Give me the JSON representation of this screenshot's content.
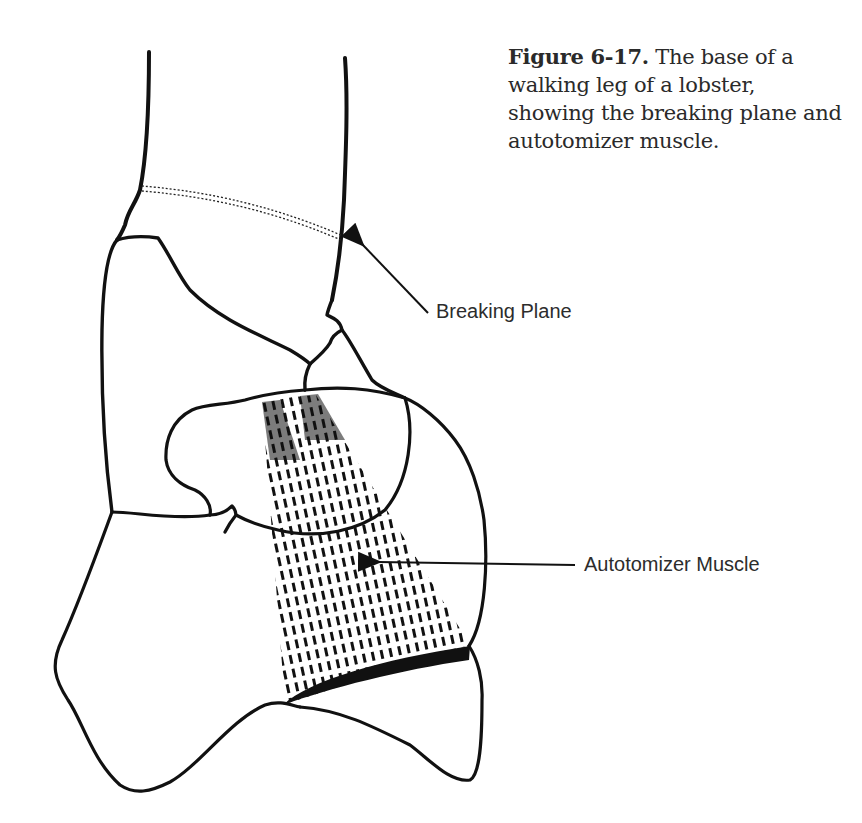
{
  "figure": {
    "caption": {
      "number": "Figure 6-17.",
      "text": " The base of a walking leg of a lobster, showing the breaking plane and autotomizer muscle."
    },
    "labels": {
      "breaking_plane": "Breaking Plane",
      "autotomizer_muscle": "Autotomizer Muscle"
    },
    "colors": {
      "ink": "#111111",
      "text": "#2a2a2a",
      "background": "#ffffff"
    }
  }
}
